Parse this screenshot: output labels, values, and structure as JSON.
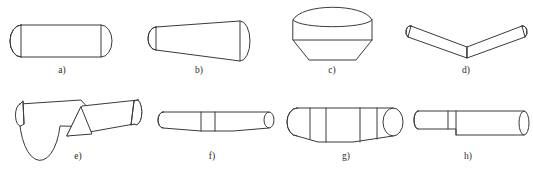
{
  "figure": {
    "background_color": "#ffffff",
    "stroke_color": "#3a3a3a",
    "fill_color": "#ffffff",
    "caption_color": "#2b2b2b",
    "width": 533,
    "height": 175,
    "rows": 2,
    "columns": 4
  },
  "items": [
    {
      "id": "a",
      "label": "a)",
      "description": "straight cylinder with elliptical end caps, uniform diameter",
      "caption_x": 62,
      "caption_y": 65
    },
    {
      "id": "b",
      "label": "b)",
      "description": "tapered cylinder (truncated cone), narrow left end, wider right end",
      "caption_x": 199,
      "caption_y": 65
    },
    {
      "id": "c",
      "label": "c)",
      "description": "vertical cylinder with domed top and conical tapered bottom",
      "caption_x": 332,
      "caption_y": 65
    },
    {
      "id": "d",
      "label": "d)",
      "description": "V shaped part, two tapered arms meeting at a sharp lower vertex",
      "caption_x": 466,
      "caption_y": 65
    },
    {
      "id": "e",
      "label": "e)",
      "description": "shallow V shaped part with triangular gusset at the lower junction",
      "caption_x": 78,
      "caption_y": 151
    },
    {
      "id": "f",
      "label": "f)",
      "description": "slender cylinder with a raised central collar section",
      "caption_x": 212,
      "caption_y": 151
    },
    {
      "id": "g",
      "label": "g)",
      "description": "cylinder with a wide central band and tapering ends with elliptical caps",
      "caption_x": 346,
      "caption_y": 151
    },
    {
      "id": "h",
      "label": "h)",
      "description": "stepped cylinder, thin left section joined to thicker right section",
      "caption_x": 468,
      "caption_y": 151
    }
  ]
}
